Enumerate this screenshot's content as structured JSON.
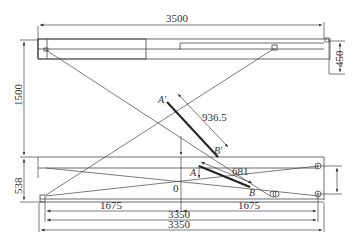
{
  "drawing": {
    "type": "scissor lift mechanism schematic",
    "dimensions": {
      "top_width": "3500",
      "left_height": "1500",
      "right_platform_height": "450",
      "lower_height": "538",
      "half_left": "1675",
      "half_right": "1675",
      "inner_width": "3350",
      "outer_width": "3350",
      "cylinder_upper_length": "936.5",
      "cylinder_lower_length": "681"
    },
    "point_labels": {
      "a_prime": "A'",
      "b_prime": "B'",
      "a": "A",
      "b": "B",
      "origin": "0"
    },
    "colors": {
      "line": "#444444",
      "thick_line": "#222222",
      "background": "#ffffff"
    }
  }
}
